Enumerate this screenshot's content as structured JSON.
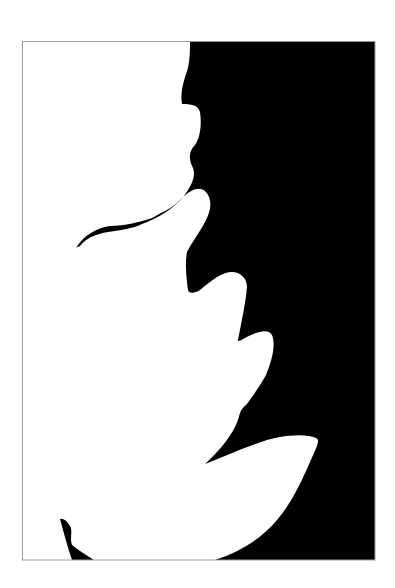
{
  "image": {
    "description": "Black and white silhouette of a leaf shape against black background inside a thin gray frame",
    "colors": {
      "background": "#ffffff",
      "fill_dark": "#000000",
      "frame": "#9a9a9a"
    },
    "frame": {
      "x": 22,
      "y": 41,
      "width": 353,
      "height": 519
    }
  }
}
